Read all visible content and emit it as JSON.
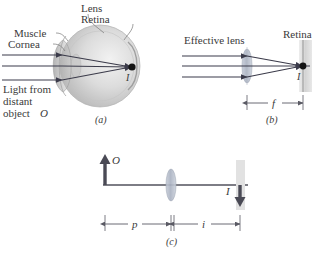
{
  "figure": {
    "title_truncated": "",
    "panels": [
      {
        "id": "a",
        "caption": "(a)",
        "labels": {
          "lens": "Lens",
          "retina": "Retina",
          "muscle": "Muscle",
          "cornea": "Cornea",
          "light_line1": "Light from",
          "light_line2": "distant",
          "light_line3": "object",
          "light_object_symbol": "O",
          "image_symbol": "I"
        }
      },
      {
        "id": "b",
        "caption": "(b)",
        "labels": {
          "effective_lens": "Effective lens",
          "retina": "Retina",
          "image_symbol": "I",
          "focal_length": "f"
        }
      },
      {
        "id": "c",
        "caption": "(c)",
        "labels": {
          "object_symbol": "O",
          "image_symbol": "I",
          "object_distance": "p",
          "image_distance": "i"
        }
      }
    ],
    "colors": {
      "ray": "#3b3b4a",
      "text": "#3a3a3a",
      "eye_fill": "#d9d9d9",
      "eye_shadow": "#a9a9a9",
      "lens_fill": "#b9bfcc",
      "retina_fill": "#d8d8d8",
      "arrow": "#4a4a55",
      "focal_dot": "#141414",
      "axis": "#52525c",
      "leader": "#6a6a6a",
      "background": "#ffffff"
    }
  }
}
